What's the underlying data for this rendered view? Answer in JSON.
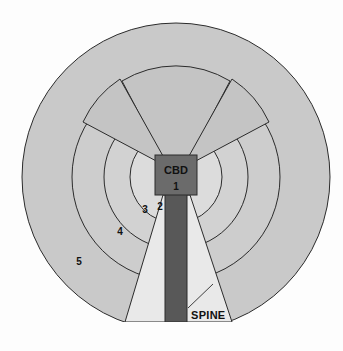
{
  "figure": {
    "width": 343,
    "height": 351
  },
  "colors": {
    "page_background": "#fdfdfd",
    "outer_ring": "#c9c9c9",
    "middle_ring": "#cdcdcd",
    "inner_ring": "#d2d2d2",
    "core_disc": "#dcdcdc",
    "corridor_wedge": "#c4c4c4",
    "light_wedge": "#e9e9e9",
    "spine_dark": "#585858",
    "cbd_block": "#6b6b6b",
    "stroke": "#2b2b2b",
    "text": "#111111"
  },
  "geometry": {
    "center_x": 176,
    "center_y": 177,
    "outer_radius": 154,
    "ring_radii": [
      46,
      72,
      104,
      154
    ],
    "clip_bottom_y": 322
  },
  "cbd": {
    "label": "CBD",
    "number": "1"
  },
  "zones": [
    {
      "id": "zone-1",
      "label": "1",
      "x": 176,
      "y": 188
    },
    {
      "id": "zone-2",
      "label": "2",
      "x": 160,
      "y": 210
    },
    {
      "id": "zone-3",
      "label": "3",
      "x": 145,
      "y": 213
    },
    {
      "id": "zone-4",
      "label": "4",
      "x": 120,
      "y": 235
    },
    {
      "id": "zone-5",
      "label": "5",
      "x": 79,
      "y": 265
    }
  ],
  "spine": {
    "label": "SPINE",
    "label_x": 191,
    "label_y": 315,
    "leader_from_x": 188,
    "leader_from_y": 308,
    "leader_to_x": 213,
    "leader_to_y": 284
  }
}
